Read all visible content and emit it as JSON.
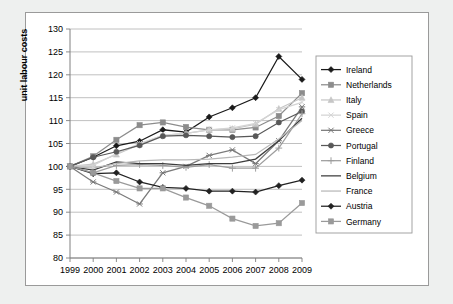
{
  "chart_data": {
    "type": "line",
    "title": "",
    "xlabel": "",
    "ylabel": "unit labour costs",
    "ylim": [
      80,
      130
    ],
    "yticks": [
      80,
      85,
      90,
      95,
      100,
      105,
      110,
      115,
      120,
      125,
      130
    ],
    "grid": true,
    "legend_position": "right",
    "x": [
      "1999",
      "2000",
      "2001",
      "2002",
      "2003",
      "2004",
      "2005",
      "2006",
      "2007",
      "2008",
      "2009"
    ],
    "categories": [
      "1999",
      "2000",
      "2001",
      "2002",
      "2003",
      "2004",
      "2005",
      "2006",
      "2007",
      "2008",
      "2009"
    ],
    "series": [
      {
        "name": "Ireland",
        "color": "#1a1a1a",
        "marker": "diamond",
        "values": [
          100.0,
          102.0,
          104.5,
          105.5,
          108.0,
          107.5,
          110.8,
          112.8,
          115.0,
          124.0,
          119.0
        ]
      },
      {
        "name": "Netherlands",
        "color": "#8c8c8c",
        "marker": "square",
        "values": [
          100.0,
          102.2,
          105.8,
          109.0,
          109.6,
          108.6,
          108.0,
          108.0,
          108.5,
          111.0,
          116.0
        ]
      },
      {
        "name": "Italy",
        "color": "#c6c6c6",
        "marker": "triangle",
        "values": [
          100.0,
          100.5,
          102.6,
          104.8,
          106.8,
          107.2,
          108.0,
          108.2,
          109.2,
          112.6,
          115.0
        ]
      },
      {
        "name": "Spain",
        "color": "#d4d4d4",
        "marker": "cross",
        "values": [
          100.0,
          100.2,
          102.8,
          105.0,
          106.8,
          107.2,
          108.0,
          108.4,
          109.4,
          112.4,
          114.0
        ]
      },
      {
        "name": "Greece",
        "color": "#7a7a7a",
        "marker": "asterisk",
        "values": [
          100.0,
          96.6,
          94.4,
          91.8,
          98.6,
          100.0,
          102.4,
          103.6,
          100.6,
          105.6,
          113.0
        ]
      },
      {
        "name": "Portugal",
        "color": "#585858",
        "marker": "circle",
        "values": [
          100.0,
          102.0,
          103.2,
          104.6,
          106.6,
          106.8,
          106.6,
          106.4,
          106.6,
          109.6,
          112.0
        ]
      },
      {
        "name": "Finland",
        "color": "#9e9e9e",
        "marker": "plus",
        "values": [
          100.0,
          98.6,
          100.2,
          100.4,
          100.2,
          99.8,
          100.4,
          99.6,
          99.6,
          104.0,
          111.5
        ]
      },
      {
        "name": "Belgium",
        "color": "#3d3d3d",
        "marker": "none",
        "values": [
          100.0,
          99.2,
          101.0,
          100.6,
          100.6,
          100.2,
          100.6,
          100.6,
          101.6,
          105.6,
          110.5
        ]
      },
      {
        "name": "France",
        "color": "#b8b8b8",
        "marker": "none",
        "values": [
          100.0,
          99.6,
          100.6,
          101.2,
          101.4,
          101.4,
          101.6,
          102.0,
          102.6,
          106.0,
          110.0
        ]
      },
      {
        "name": "Austria",
        "color": "#222222",
        "marker": "diamond",
        "values": [
          100.0,
          98.4,
          98.6,
          96.6,
          95.4,
          95.2,
          94.6,
          94.6,
          94.4,
          95.8,
          97.0
        ]
      },
      {
        "name": "Germany",
        "color": "#9a9a9a",
        "marker": "square",
        "values": [
          100.0,
          98.6,
          96.8,
          95.2,
          95.2,
          93.2,
          91.4,
          88.6,
          87.0,
          87.6,
          92.0
        ]
      }
    ]
  },
  "legend": {
    "items": [
      {
        "label": "Ireland"
      },
      {
        "label": "Netherlands"
      },
      {
        "label": "Italy"
      },
      {
        "label": "Spain"
      },
      {
        "label": "Greece"
      },
      {
        "label": "Portugal"
      },
      {
        "label": "Finland"
      },
      {
        "label": "Belgium"
      },
      {
        "label": "France"
      },
      {
        "label": "Austria"
      },
      {
        "label": "Germany"
      }
    ]
  },
  "colors": {
    "background": "#eef0ef",
    "panel": "#ffffff",
    "grid": "#b0b0b0",
    "axis": "#808080",
    "text": "#000000"
  }
}
